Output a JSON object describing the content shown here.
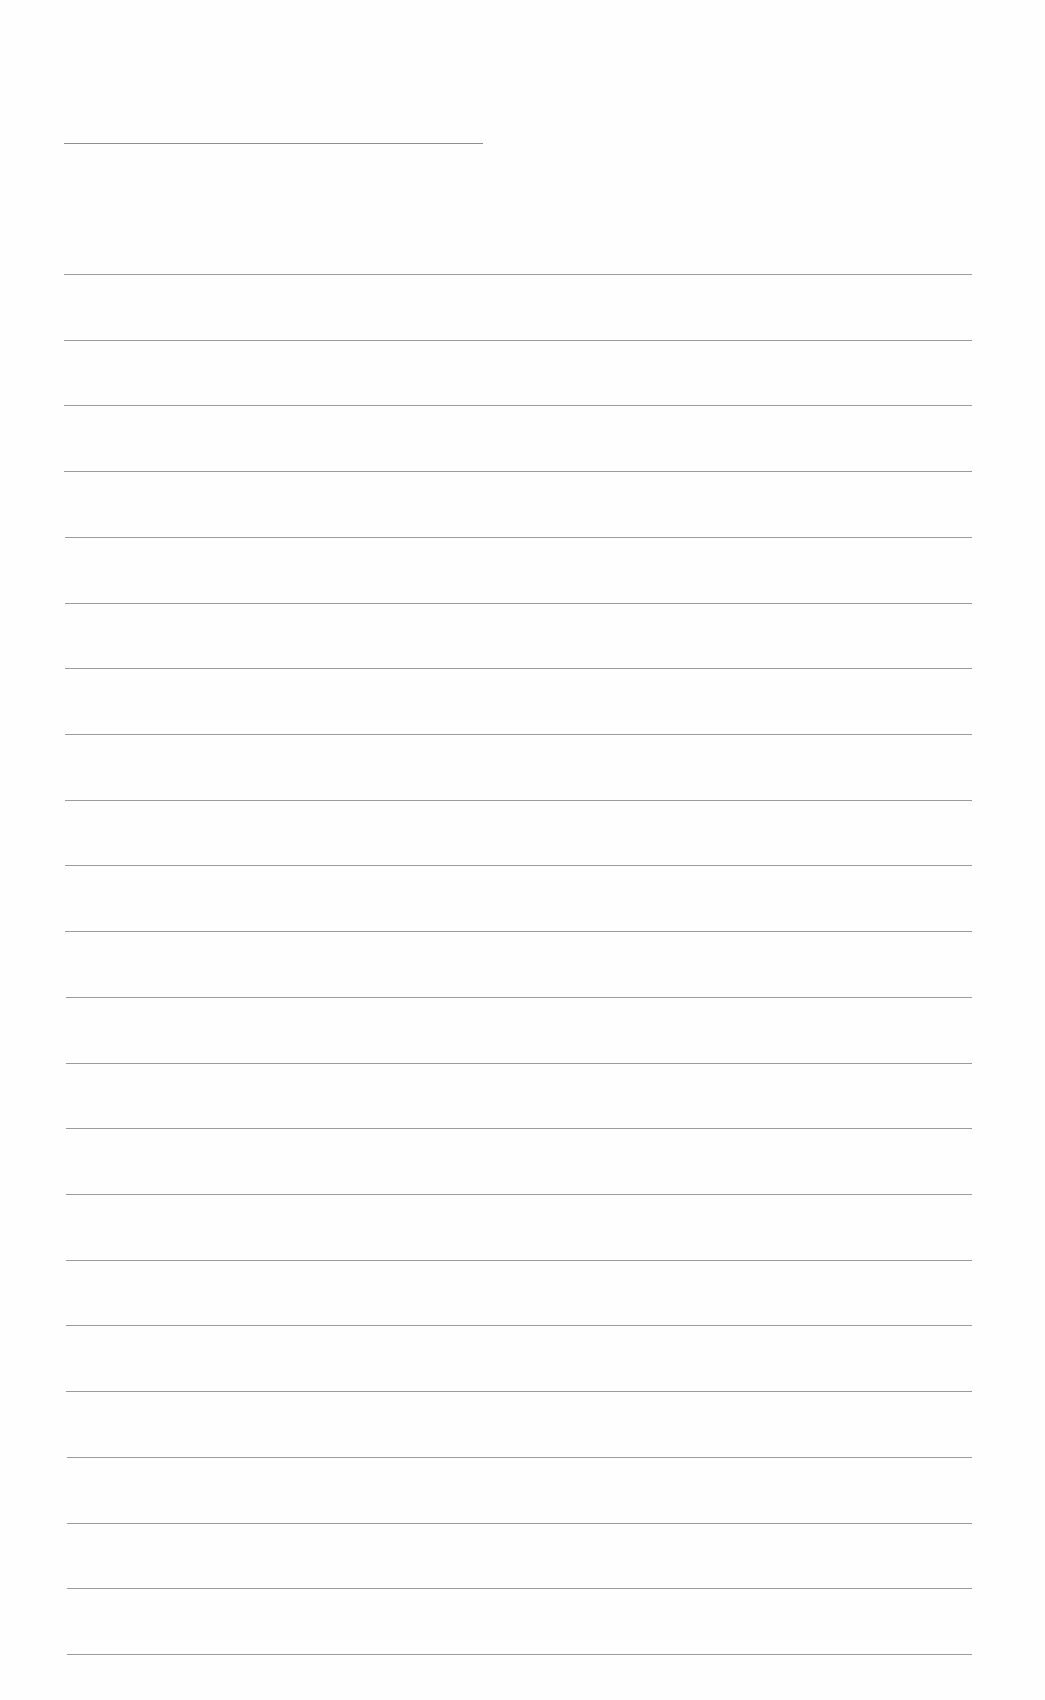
{
  "document": {
    "type": "blank lined paper",
    "header_rule": {
      "present": true
    },
    "ruled_lines_count": 22,
    "line_color": "#8a8a8a",
    "background_color": "#fefefe"
  }
}
